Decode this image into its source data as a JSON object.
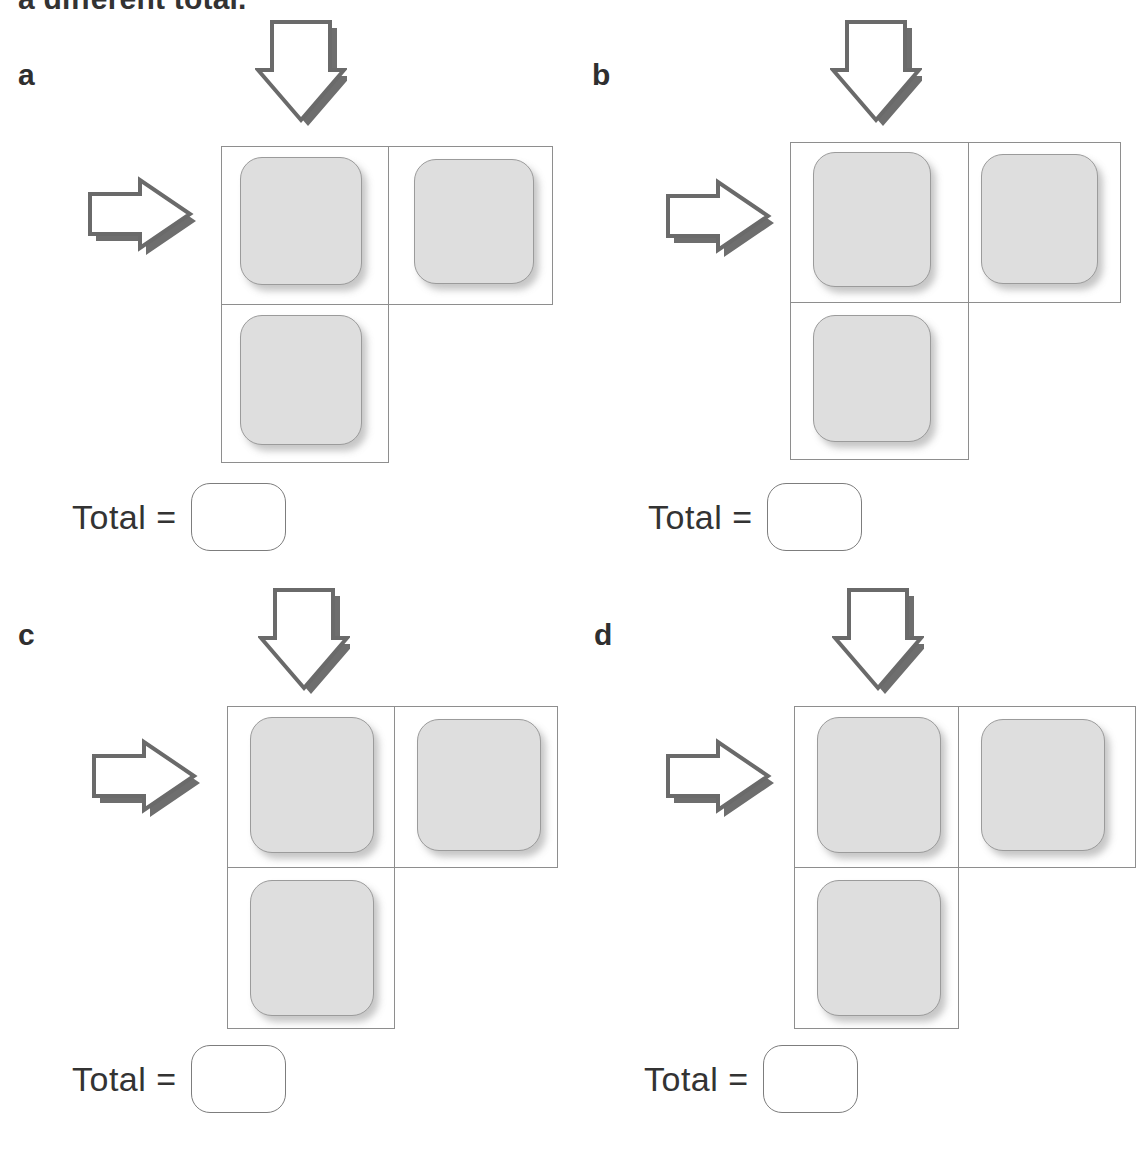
{
  "page": {
    "heading_clipped": "a different total.",
    "background_color": "#ffffff",
    "tile_fill_color": "#dedede",
    "tile_border_color": "#9b9b9b",
    "grid_line_color": "#8e8e8e",
    "arrow_outline_color": "#6a6a6a",
    "arrow_shadow_color": "#6e6e6e",
    "text_color": "#333333"
  },
  "panels": [
    {
      "letter": "a",
      "total_label": "Total =",
      "answer_value": "",
      "answer_placeholder": "",
      "down_arrow": "arrow-down-icon",
      "right_arrow": "arrow-right-icon",
      "grid": {
        "shape": "L",
        "rows": 2,
        "columns": 2,
        "tiles": 3,
        "cells": [
          {
            "row": 1,
            "col": 1,
            "filled": true
          },
          {
            "row": 1,
            "col": 2,
            "filled": true
          },
          {
            "row": 2,
            "col": 1,
            "filled": true
          }
        ]
      }
    },
    {
      "letter": "b",
      "total_label": "Total =",
      "answer_value": "",
      "answer_placeholder": "",
      "down_arrow": "arrow-down-icon",
      "right_arrow": "arrow-right-icon",
      "grid": {
        "shape": "L",
        "rows": 2,
        "columns": 2,
        "tiles": 3,
        "cells": [
          {
            "row": 1,
            "col": 1,
            "filled": true
          },
          {
            "row": 1,
            "col": 2,
            "filled": true
          },
          {
            "row": 2,
            "col": 1,
            "filled": true
          }
        ]
      }
    },
    {
      "letter": "c",
      "total_label": "Total =",
      "answer_value": "",
      "answer_placeholder": "",
      "down_arrow": "arrow-down-icon",
      "right_arrow": "arrow-right-icon",
      "grid": {
        "shape": "L",
        "rows": 2,
        "columns": 2,
        "tiles": 3,
        "cells": [
          {
            "row": 1,
            "col": 1,
            "filled": true
          },
          {
            "row": 1,
            "col": 2,
            "filled": true
          },
          {
            "row": 2,
            "col": 1,
            "filled": true
          }
        ]
      }
    },
    {
      "letter": "d",
      "total_label": "Total =",
      "answer_value": "",
      "answer_placeholder": "",
      "down_arrow": "arrow-down-icon",
      "right_arrow": "arrow-right-icon",
      "grid": {
        "shape": "L",
        "rows": 2,
        "columns": 2,
        "tiles": 3,
        "cells": [
          {
            "row": 1,
            "col": 1,
            "filled": true
          },
          {
            "row": 1,
            "col": 2,
            "filled": true
          },
          {
            "row": 2,
            "col": 1,
            "filled": true
          }
        ]
      }
    }
  ]
}
